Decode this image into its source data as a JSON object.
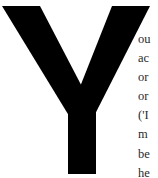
{
  "document": {
    "drop_cap": {
      "letter": "Y",
      "color": "#000000"
    },
    "lines": [
      "ou",
      "ac",
      "or",
      "or",
      "('I",
      "m",
      "be",
      "he"
    ],
    "text_color": "#2a2a2a",
    "background": "#ffffff"
  }
}
